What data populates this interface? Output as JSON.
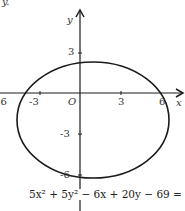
{
  "figure": {
    "corner_text": "y.",
    "axes": {
      "x_label": "x",
      "y_label": "y",
      "origin_label": "O",
      "x_ticks": [
        "-6",
        "-3",
        "3",
        "6"
      ],
      "y_ticks": [
        "3",
        "-3",
        "-6"
      ]
    },
    "curve": {
      "type": "ellipse",
      "equation": "5x² + 5y² − 6x + 20y − 69 = 0",
      "center": [
        0.6,
        -2
      ],
      "radius": 4.3
    },
    "colors": {
      "stroke": "#1a1a1a",
      "background": "#ffffff"
    }
  }
}
